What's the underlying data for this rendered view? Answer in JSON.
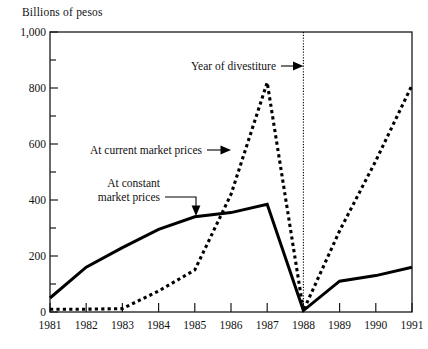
{
  "chart_data": {
    "type": "line",
    "title": "",
    "ylabel": "Billions of pesos",
    "xlabel": "",
    "ylim": [
      0,
      1000
    ],
    "xlim": [
      1981,
      1991
    ],
    "grid": false,
    "legend_position": "inline-annotations",
    "x": [
      1981,
      1982,
      1983,
      1984,
      1985,
      1986,
      1987,
      1988,
      1989,
      1990,
      1991
    ],
    "y_ticks": [
      0,
      200,
      400,
      600,
      800,
      1000
    ],
    "y_tick_labels": [
      "0",
      "200",
      "400",
      "600",
      "800",
      "1,000"
    ],
    "y_minor_ticks": [
      100,
      300,
      500,
      700,
      900
    ],
    "x_tick_labels": [
      "1981",
      "1982",
      "1983",
      "1984",
      "1985",
      "1986",
      "1987",
      "1988",
      "1989",
      "1990",
      "1991"
    ],
    "series": [
      {
        "name": "At constant market prices",
        "style": "solid",
        "values": [
          50,
          160,
          230,
          295,
          340,
          355,
          385,
          5,
          110,
          130,
          160
        ]
      },
      {
        "name": "At current market prices",
        "style": "dotted",
        "values": [
          10,
          10,
          12,
          75,
          150,
          420,
          820,
          5,
          290,
          540,
          810
        ]
      }
    ],
    "annotations": [
      {
        "text": "Year of divestiture",
        "at_x": 1988,
        "kind": "vertical-marker-arrow"
      },
      {
        "text": "At current market prices",
        "kind": "series-pointer"
      },
      {
        "text": "At constant",
        "kind": "series-pointer-line1"
      },
      {
        "text": "market prices",
        "kind": "series-pointer-line2"
      }
    ]
  },
  "axis": {
    "y_title": "Billions of pesos",
    "y_labels": [
      "1,000",
      "800",
      "600",
      "400",
      "200",
      "0"
    ],
    "x_labels": [
      "1981",
      "1982",
      "1983",
      "1984",
      "1985",
      "1986",
      "1987",
      "1988",
      "1989",
      "1990",
      "1991"
    ]
  },
  "annotations": {
    "divestiture": "Year of divestiture",
    "current_prices": "At current market prices",
    "constant_prices_line1": "At constant",
    "constant_prices_line2": "market prices"
  },
  "colors": {
    "ink": "#111111",
    "background": "#ffffff"
  }
}
